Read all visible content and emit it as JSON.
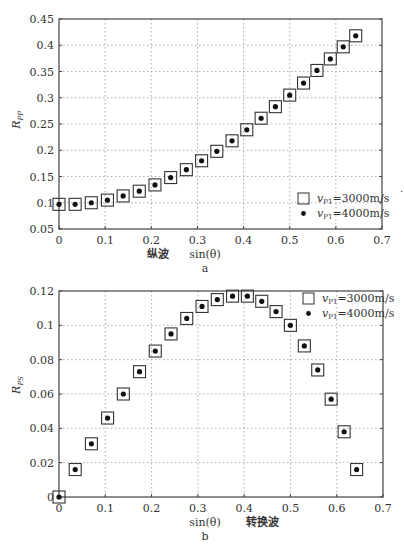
{
  "chart_data": [
    {
      "id": "a",
      "type": "scatter",
      "title": "",
      "caption": "a",
      "xlabel": "sin(θ)",
      "xlabel_note": "纵波",
      "ylabel": "R_PP",
      "ylabel_main": "R",
      "ylabel_sub": "PP",
      "xlim": [
        0,
        0.7
      ],
      "ylim": [
        0.05,
        0.45
      ],
      "xticks": [
        0,
        0.1,
        0.2,
        0.3,
        0.4,
        0.5,
        0.6,
        0.7
      ],
      "xtick_labels": [
        "0",
        "0.1",
        "0.2",
        "0.3",
        "0.4",
        "0.5",
        "0.6",
        "0.7"
      ],
      "yticks": [
        0.05,
        0.1,
        0.15,
        0.2,
        0.25,
        0.3,
        0.35,
        0.4,
        0.45
      ],
      "ytick_labels": [
        "0.05",
        "0.1",
        "0.15",
        "0.2",
        "0.25",
        "0.3",
        "0.35",
        "0.4",
        "0.45"
      ],
      "grid": true,
      "legend_position": "lower right",
      "x": [
        0,
        0.035,
        0.07,
        0.105,
        0.139,
        0.174,
        0.208,
        0.242,
        0.276,
        0.309,
        0.342,
        0.375,
        0.407,
        0.438,
        0.469,
        0.5,
        0.53,
        0.559,
        0.588,
        0.616,
        0.643
      ],
      "series": [
        {
          "name": "v_P1=3000m/s",
          "marker": "open-square",
          "values": [
            0.097,
            0.097,
            0.1,
            0.105,
            0.113,
            0.122,
            0.134,
            0.148,
            0.163,
            0.18,
            0.198,
            0.218,
            0.239,
            0.261,
            0.283,
            0.305,
            0.328,
            0.352,
            0.374,
            0.397,
            0.418
          ]
        },
        {
          "name": "v_P1=4000m/s",
          "marker": "dot",
          "values": [
            0.097,
            0.097,
            0.1,
            0.105,
            0.113,
            0.122,
            0.134,
            0.148,
            0.163,
            0.18,
            0.198,
            0.218,
            0.239,
            0.261,
            0.283,
            0.305,
            0.328,
            0.352,
            0.374,
            0.397,
            0.418
          ]
        }
      ]
    },
    {
      "id": "b",
      "type": "scatter",
      "title": "",
      "caption": "b",
      "xlabel": "sin(θ)",
      "xlabel_note": "转换波",
      "ylabel": "R_PS",
      "ylabel_main": "R",
      "ylabel_sub": "PS",
      "xlim": [
        0,
        0.7
      ],
      "ylim": [
        0,
        0.12
      ],
      "xticks": [
        0,
        0.1,
        0.2,
        0.3,
        0.4,
        0.5,
        0.6,
        0.7
      ],
      "xtick_labels": [
        "0",
        "0.1",
        "0.2",
        "0.3",
        "0.4",
        "0.5",
        "0.6",
        "0.7"
      ],
      "yticks": [
        0,
        0.02,
        0.04,
        0.06,
        0.08,
        0.1,
        0.12
      ],
      "ytick_labels": [
        "0",
        "0.02",
        "0.04",
        "0.06",
        "0.08",
        "0.1",
        "0.12"
      ],
      "grid": true,
      "legend_position": "upper right",
      "x": [
        0,
        0.035,
        0.07,
        0.105,
        0.139,
        0.174,
        0.208,
        0.242,
        0.276,
        0.309,
        0.342,
        0.375,
        0.407,
        0.438,
        0.469,
        0.5,
        0.53,
        0.559,
        0.588,
        0.616,
        0.643
      ],
      "series": [
        {
          "name": "v_P1=3000m/s",
          "marker": "open-square",
          "values": [
            0.0,
            0.016,
            0.031,
            0.046,
            0.06,
            0.073,
            0.085,
            0.095,
            0.104,
            0.111,
            0.115,
            0.117,
            0.117,
            0.114,
            0.108,
            0.1,
            0.088,
            0.074,
            0.057,
            0.038,
            0.016
          ]
        },
        {
          "name": "v_P1=4000m/s",
          "marker": "dot",
          "values": [
            0.0,
            0.016,
            0.031,
            0.046,
            0.06,
            0.073,
            0.085,
            0.095,
            0.104,
            0.111,
            0.115,
            0.117,
            0.117,
            0.114,
            0.108,
            0.1,
            0.088,
            0.074,
            0.057,
            0.038,
            0.016
          ]
        }
      ]
    }
  ],
  "legend": {
    "entries": [
      {
        "symbol": "open-square",
        "v": "v",
        "sub": "P1",
        "text": "=3000m/s"
      },
      {
        "symbol": "dot",
        "v": "v",
        "sub": "P1",
        "text": "=4000m/s"
      }
    ]
  }
}
